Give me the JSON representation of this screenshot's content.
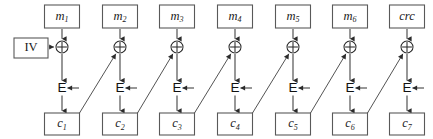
{
  "diagram": {
    "type": "block-cipher-chaining",
    "width": 433,
    "height": 139,
    "colors": {
      "background": "#ffffff",
      "box_stroke": "#595959",
      "line": "#3a3a3a",
      "text": "#1a1a1a"
    },
    "iv_block": {
      "label": "IV",
      "x": 14,
      "y": 38,
      "w": 34,
      "h": 20
    },
    "cipher_glyph": "E",
    "xor_glyph": "⊕",
    "columns": [
      {
        "index": 1,
        "center_x": 62,
        "plaintext_label": "m",
        "plaintext_sub": "1",
        "plaintext_italic": true,
        "ciphertext_label": "c",
        "ciphertext_sub": "1",
        "cipher_label": "E",
        "has_feedback_in": false,
        "has_feedback_out": true,
        "has_iv_in": true
      },
      {
        "index": 2,
        "center_x": 120,
        "plaintext_label": "m",
        "plaintext_sub": "2",
        "plaintext_italic": true,
        "ciphertext_label": "c",
        "ciphertext_sub": "2",
        "cipher_label": "E",
        "has_feedback_in": true,
        "has_feedback_out": true,
        "has_iv_in": false
      },
      {
        "index": 3,
        "center_x": 177,
        "plaintext_label": "m",
        "plaintext_sub": "3",
        "plaintext_italic": true,
        "ciphertext_label": "c",
        "ciphertext_sub": "3",
        "cipher_label": "E",
        "has_feedback_in": true,
        "has_feedback_out": true,
        "has_iv_in": false
      },
      {
        "index": 4,
        "center_x": 235,
        "plaintext_label": "m",
        "plaintext_sub": "4",
        "plaintext_italic": true,
        "ciphertext_label": "c",
        "ciphertext_sub": "4",
        "cipher_label": "E",
        "has_feedback_in": true,
        "has_feedback_out": true,
        "has_iv_in": false
      },
      {
        "index": 5,
        "center_x": 293,
        "plaintext_label": "m",
        "plaintext_sub": "5",
        "plaintext_italic": true,
        "ciphertext_label": "c",
        "ciphertext_sub": "5",
        "cipher_label": "E",
        "has_feedback_in": true,
        "has_feedback_out": true,
        "has_iv_in": false
      },
      {
        "index": 6,
        "center_x": 350,
        "plaintext_label": "m",
        "plaintext_sub": "6",
        "plaintext_italic": true,
        "ciphertext_label": "c",
        "ciphertext_sub": "6",
        "cipher_label": "E",
        "has_feedback_in": true,
        "has_feedback_out": true,
        "has_iv_in": false
      },
      {
        "index": 7,
        "center_x": 407,
        "plaintext_label": "crc",
        "plaintext_sub": "",
        "plaintext_italic": true,
        "ciphertext_label": "c",
        "ciphertext_sub": "7",
        "cipher_label": "E",
        "has_feedback_in": true,
        "has_feedback_out": false,
        "has_iv_in": false
      }
    ],
    "geometry": {
      "top_box_y": 5,
      "top_box_h": 23,
      "box_w": 35,
      "xor_y": 47,
      "xor_r": 6,
      "cipher_y": 88,
      "bottom_box_y": 113,
      "bottom_box_h": 22
    }
  }
}
